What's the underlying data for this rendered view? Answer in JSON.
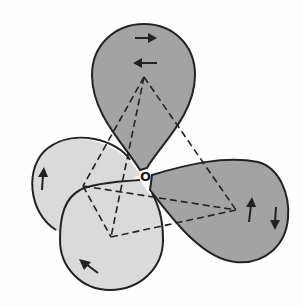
{
  "diagram": {
    "type": "orbital-hybridization",
    "center_atom": {
      "label": "O",
      "x": 145,
      "y": 177
    },
    "colors": {
      "dark_lobe": "#a3a3a3",
      "light_lobe": "#dadada",
      "outline": "#222222",
      "dashed": "#222222"
    },
    "lobes": [
      {
        "id": "top",
        "shade": "dark",
        "electrons": [
          "up-right-arrow",
          "left-arrow"
        ]
      },
      {
        "id": "right",
        "shade": "dark",
        "electrons": [
          "up-arrow",
          "down-arrow"
        ]
      },
      {
        "id": "left-back",
        "shade": "light",
        "electrons": [
          "up-arrow"
        ]
      },
      {
        "id": "front-bottom",
        "shade": "light",
        "electrons": [
          "up-left-arrow"
        ]
      }
    ],
    "tetrahedron_vertices": [
      {
        "id": "top",
        "x": 144,
        "y": 77
      },
      {
        "id": "left",
        "x": 83,
        "y": 186
      },
      {
        "id": "right",
        "x": 236,
        "y": 210
      },
      {
        "id": "bottom",
        "x": 111,
        "y": 237
      }
    ]
  }
}
